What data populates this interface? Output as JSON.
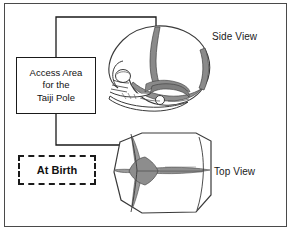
{
  "figure": {
    "title_alt": "Infant skull fontanelle diagram",
    "frame": {
      "border_color": "#4a4a4a"
    }
  },
  "callout": {
    "lines": [
      "Access Area",
      "for the",
      "Taiji Pole"
    ],
    "border_color": "#1a1a1a",
    "style": "solid"
  },
  "at_birth": {
    "label": "At Birth",
    "border_color": "#1a1a1a",
    "style": "dashed"
  },
  "labels": {
    "side_view": "Side View",
    "top_view": "Top View"
  },
  "illustrations": [
    {
      "name": "infant-skull-side-view",
      "description": "Lateral view of a newborn skull showing cranial vault, coronal suture, facial bones, orbit and mandible",
      "shading_color": "#8c8c8c",
      "outline_color": "#333333"
    },
    {
      "name": "infant-skull-top-view",
      "description": "Superior view of a newborn skull showing the cross shaped anterior fontanelle and sagittal, coronal and metopic sutures",
      "shading_color": "#9a9a9a",
      "outline_color": "#333333"
    }
  ],
  "leader_lines": [
    {
      "name": "leader-to-side-view",
      "from": "callout-box-top",
      "to": "side-view-fontanelle"
    },
    {
      "name": "leader-to-top-view",
      "from": "callout-box-bottom",
      "to": "top-view-fontanelle"
    }
  ],
  "colors": {
    "ink": "#1a1a1a",
    "frame": "#4a4a4a",
    "suture_fill": "#909090",
    "background": "#ffffff"
  }
}
